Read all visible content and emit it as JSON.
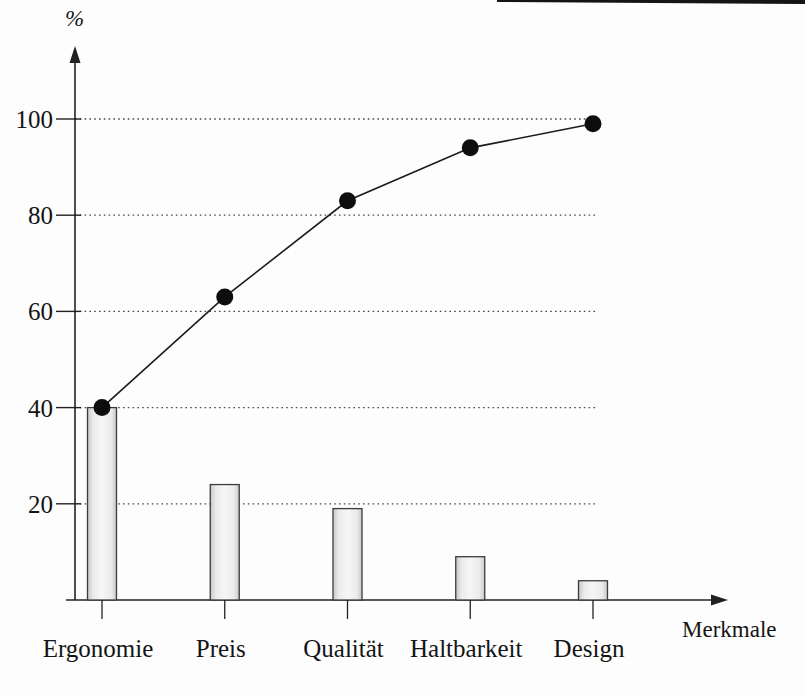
{
  "page": {
    "background": "#fdfdfd"
  },
  "chart": {
    "y_unit_label": "%",
    "x_axis_label": "Merkmale"
  },
  "chart_data": {
    "type": "bar",
    "variant": "pareto",
    "title": "",
    "categories": [
      "Ergonomie",
      "Preis",
      "Qualität",
      "Haltbarkeit",
      "Design"
    ],
    "bar_values": [
      40,
      24,
      19,
      9,
      4
    ],
    "cumulative_line_values": [
      40,
      63,
      83,
      94,
      99
    ],
    "xlabel": "Merkmale",
    "ylabel": "%",
    "yticks": [
      100,
      80,
      60,
      40,
      20
    ],
    "ylim": [
      0,
      114
    ],
    "grid": "dotted-horizontal",
    "legend": "none"
  },
  "colors": {
    "background": "#fdfdfd",
    "axis": "#222222",
    "grid": "#4a4a4a",
    "text": "#141414",
    "bar_stroke": "#3c3c3c",
    "bar_fill_dark": "#c7c7c7",
    "bar_fill": "#ebebeb",
    "bar_fill_light": "#f6f6f6",
    "line": "#1c1c1c",
    "dot": "#0d0d0d",
    "top_rule": "#151515"
  }
}
